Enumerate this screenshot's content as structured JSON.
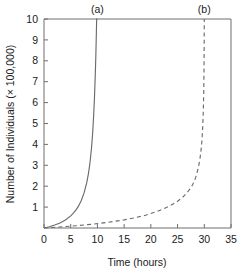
{
  "chart_data": {
    "type": "line",
    "title": "",
    "xlabel": "Time (hours)",
    "ylabel": "Number of Individuals (× 100,000)",
    "xlim": [
      0,
      35
    ],
    "ylim": [
      0,
      10
    ],
    "xticks": [
      0,
      5,
      10,
      15,
      20,
      25,
      30,
      35
    ],
    "yticks": [
      1,
      2,
      3,
      4,
      5,
      6,
      7,
      8,
      9,
      10
    ],
    "xtick_labels": [
      "0",
      "5",
      "10",
      "15",
      "20",
      "25",
      "30",
      "35"
    ],
    "ytick_labels": [
      "1",
      "2",
      "3",
      "4",
      "5",
      "6",
      "7",
      "8",
      "9",
      "10"
    ],
    "grid": false,
    "legend_position": "none",
    "annotations": [
      {
        "text": "(a)",
        "x": 10,
        "y": 10,
        "placement": "above-axis"
      },
      {
        "text": "(b)",
        "x": 30,
        "y": 10,
        "placement": "above-axis"
      }
    ],
    "series": [
      {
        "name": "(a)",
        "style": "solid",
        "color": "#6b6b6b",
        "asymptote_x": 10,
        "x": [
          0.0,
          1.0,
          2.0,
          3.0,
          4.0,
          5.0,
          5.5,
          6.0,
          6.5,
          7.0,
          7.5,
          8.0,
          8.3,
          8.6,
          8.9,
          9.1,
          9.3,
          9.45,
          9.6,
          9.7,
          9.8,
          9.86,
          9.91,
          9.95,
          9.97,
          9.99,
          10.0
        ],
        "y": [
          0.0,
          0.06,
          0.14,
          0.24,
          0.38,
          0.58,
          0.71,
          0.87,
          1.07,
          1.33,
          1.68,
          2.17,
          2.58,
          3.11,
          3.85,
          4.52,
          5.42,
          6.26,
          7.35,
          8.23,
          9.33,
          10.0,
          10.0,
          10.0,
          10.0,
          10.0,
          10.0
        ]
      },
      {
        "name": "(b)",
        "style": "dashed",
        "color": "#6b6b6b",
        "asymptote_x": 30,
        "x": [
          0.0,
          3.0,
          6.0,
          9.0,
          12.0,
          15.0,
          17.0,
          19.0,
          21.0,
          22.5,
          24.0,
          25.0,
          26.0,
          27.0,
          27.8,
          28.4,
          28.9,
          29.2,
          29.45,
          29.6,
          29.72,
          29.82,
          29.9,
          29.95,
          29.98,
          30.0
        ],
        "y": [
          0.0,
          0.05,
          0.11,
          0.18,
          0.27,
          0.39,
          0.49,
          0.61,
          0.78,
          0.93,
          1.12,
          1.28,
          1.48,
          1.76,
          2.06,
          2.42,
          2.9,
          3.33,
          3.85,
          4.34,
          4.9,
          5.62,
          6.52,
          7.6,
          9.0,
          10.0
        ]
      }
    ]
  },
  "figure": {
    "axis_color": "#6e6e6e",
    "text_color": "#1a1a1a",
    "background": "#ffffff"
  }
}
